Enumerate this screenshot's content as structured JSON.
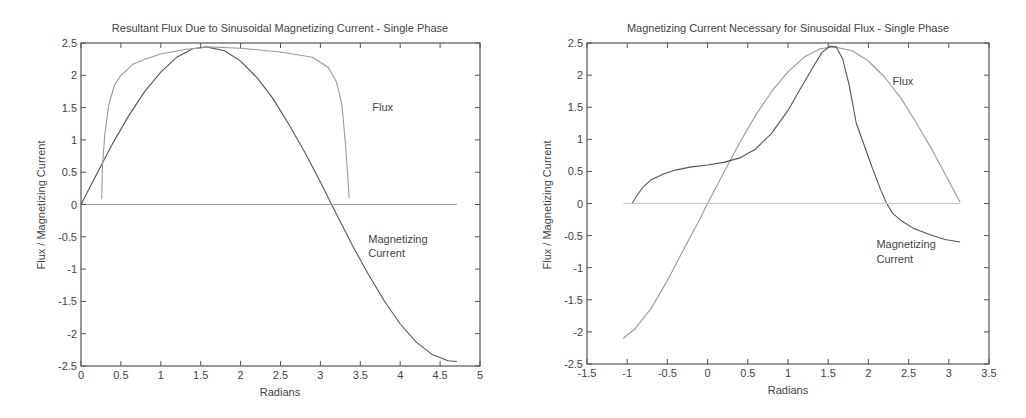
{
  "chart_data": [
    {
      "type": "line",
      "title": "Resultant Flux Due to Sinusoidal Magnetizing Current - Single Phase",
      "xlabel": "Radians",
      "ylabel": "Flux / Magnetizing Current",
      "xlim": [
        0,
        5
      ],
      "ylim": [
        -2.5,
        2.5
      ],
      "xticks": [
        0,
        0.5,
        1,
        1.5,
        2,
        2.5,
        3,
        3.5,
        4,
        4.5,
        5
      ],
      "xtick_labels": [
        "0",
        "0.5",
        "1",
        "1.5",
        "2",
        "2.5",
        "3",
        "3.5",
        "4",
        "4.5",
        "5"
      ],
      "yticks": [
        2.5,
        2,
        1.5,
        1,
        0.5,
        0,
        -0.5,
        -1,
        -1.5,
        -2,
        -2.5
      ],
      "ytick_labels": [
        "2.5",
        "2",
        "1.5",
        "1",
        "0.5",
        "0",
        "-0.5",
        "-1",
        "-1.5",
        "-2",
        "-2.5"
      ],
      "grid": false,
      "series": [
        {
          "name": "Magnetizing Current",
          "color": "#555555",
          "x": [
            0,
            0.2,
            0.4,
            0.6,
            0.8,
            1.0,
            1.2,
            1.4,
            1.57,
            1.8,
            2.0,
            2.2,
            2.4,
            2.6,
            2.8,
            3.0,
            3.14,
            3.4,
            3.6,
            3.8,
            4.0,
            4.2,
            4.4,
            4.6,
            4.71
          ],
          "y": [
            0,
            0.48,
            0.95,
            1.38,
            1.75,
            2.05,
            2.28,
            2.41,
            2.44,
            2.38,
            2.22,
            1.97,
            1.65,
            1.25,
            0.82,
            0.35,
            0.0,
            -0.63,
            -1.08,
            -1.49,
            -1.85,
            -2.13,
            -2.32,
            -2.42,
            -2.43
          ]
        },
        {
          "name": "Flux",
          "color": "#9a9a9a",
          "x": [
            0.26,
            0.27,
            0.3,
            0.35,
            0.42,
            0.5,
            0.65,
            0.8,
            1.0,
            1.3,
            1.6,
            2.0,
            2.5,
            2.9,
            3.1,
            3.2,
            3.27,
            3.31,
            3.34,
            3.36
          ],
          "y": [
            0.08,
            0.6,
            1.1,
            1.55,
            1.85,
            2.0,
            2.17,
            2.25,
            2.33,
            2.4,
            2.44,
            2.42,
            2.36,
            2.28,
            2.12,
            1.9,
            1.55,
            1.0,
            0.5,
            0.1
          ]
        },
        {
          "name": "Zero line",
          "color": "#9a9a9a",
          "x": [
            0,
            4.71
          ],
          "y": [
            0,
            0
          ]
        }
      ],
      "annotations": [
        {
          "text": "Flux",
          "x": 3.65,
          "y": 1.45
        },
        {
          "text": "Magnetizing",
          "x": 3.6,
          "y": -0.6
        },
        {
          "text": "Current",
          "x": 3.6,
          "y": -0.82
        }
      ]
    },
    {
      "type": "line",
      "title": "Magnetizing Current Necessary for Sinusoidal Flux - Single Phase",
      "xlabel": "Radians",
      "ylabel": "Flux / Magnetizing Current",
      "xlim": [
        -1.5,
        3.5
      ],
      "ylim": [
        -2.5,
        2.5
      ],
      "xticks": [
        -1.5,
        -1,
        -0.5,
        0,
        0.5,
        1,
        1.5,
        2,
        2.5,
        3,
        3.5
      ],
      "xtick_labels": [
        "-1.5",
        "-1",
        "-0.5",
        "0",
        "0.5",
        "1",
        "1.5",
        "2",
        "2.5",
        "3",
        "3.5"
      ],
      "yticks": [
        2.5,
        2,
        1.5,
        1,
        0.5,
        0,
        -0.5,
        -1,
        -1.5,
        -2,
        -2.5
      ],
      "ytick_labels": [
        "2.5",
        "2",
        "1.5",
        "1",
        "0.5",
        "0",
        "-0.5",
        "-1",
        "-1.5",
        "-2",
        "-2.5"
      ],
      "grid": false,
      "series": [
        {
          "name": "Flux",
          "color": "#9a9a9a",
          "x": [
            -1.05,
            -0.9,
            -0.7,
            -0.5,
            -0.3,
            -0.1,
            0.0,
            0.2,
            0.4,
            0.6,
            0.8,
            1.0,
            1.2,
            1.4,
            1.57,
            1.8,
            2.0,
            2.2,
            2.4,
            2.6,
            2.8,
            3.0,
            3.14
          ],
          "y": [
            -2.1,
            -1.95,
            -1.63,
            -1.2,
            -0.72,
            -0.25,
            0.0,
            0.48,
            0.95,
            1.38,
            1.75,
            2.05,
            2.28,
            2.41,
            2.44,
            2.38,
            2.22,
            1.97,
            1.65,
            1.25,
            0.82,
            0.35,
            0.02
          ]
        },
        {
          "name": "Magnetizing Current",
          "color": "#555555",
          "x": [
            -0.94,
            -0.88,
            -0.8,
            -0.7,
            -0.55,
            -0.4,
            -0.2,
            0.0,
            0.2,
            0.4,
            0.6,
            0.8,
            1.0,
            1.15,
            1.3,
            1.42,
            1.52,
            1.6,
            1.68,
            1.76,
            1.85,
            1.95,
            2.05,
            2.15,
            2.22,
            2.3,
            2.4,
            2.55,
            2.75,
            2.95,
            3.14
          ],
          "y": [
            0.0,
            0.12,
            0.26,
            0.37,
            0.46,
            0.52,
            0.57,
            0.6,
            0.64,
            0.71,
            0.85,
            1.1,
            1.45,
            1.78,
            2.1,
            2.35,
            2.45,
            2.44,
            2.25,
            1.85,
            1.25,
            0.9,
            0.55,
            0.22,
            0.02,
            -0.15,
            -0.26,
            -0.38,
            -0.48,
            -0.56,
            -0.6
          ]
        },
        {
          "name": "Zero line",
          "color": "#c8c8c8",
          "x": [
            -1.05,
            3.14
          ],
          "y": [
            0,
            0
          ]
        }
      ],
      "annotations": [
        {
          "text": "Flux",
          "x": 2.3,
          "y": 1.85
        },
        {
          "text": "Magnetizing",
          "x": 2.1,
          "y": -0.7
        },
        {
          "text": "Current",
          "x": 2.1,
          "y": -0.92
        }
      ]
    }
  ]
}
